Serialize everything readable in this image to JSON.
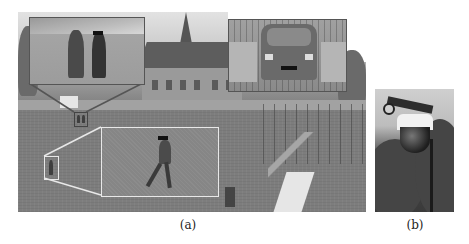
{
  "figure": {
    "panels": [
      {
        "id": "a",
        "caption": "(a)",
        "description": "Wide-angle grayscale surveillance scene of an outdoor area with lawn, house, church steeple, fence and scaffolding",
        "insets": [
          {
            "name": "two-pedestrians-zoom",
            "description": "Magnified view of two pedestrians with face censor bar"
          },
          {
            "name": "car-zoom",
            "description": "Magnified view of a car with license plate censored"
          },
          {
            "name": "walking-person-zoom",
            "description": "Magnified view of a single walking person with face censor bar"
          }
        ]
      },
      {
        "id": "b",
        "caption": "(b)",
        "description": "Pan-tilt-zoom dome surveillance camera mounted on a pole against trees"
      }
    ]
  },
  "colors": {
    "inset_dark_border": "#555555",
    "inset_light_border": "#e8e8e8",
    "censor_bar": "#111111"
  }
}
